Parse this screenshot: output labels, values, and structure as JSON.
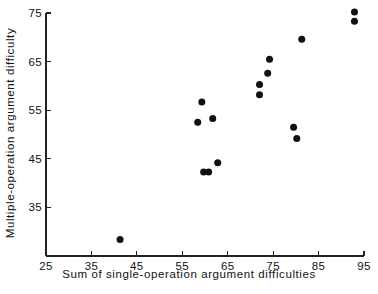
{
  "chart_data": {
    "type": "scatter",
    "title": "",
    "xlabel": "Sum of single-operation argument difficulties",
    "ylabel": "Multiple-operation argument difficulty",
    "xlim": [
      25,
      95
    ],
    "ylim": [
      25,
      75
    ],
    "xticks": [
      25,
      35,
      45,
      55,
      65,
      75,
      85,
      95
    ],
    "yticks": [
      35,
      45,
      55,
      65,
      75
    ],
    "xtick_labels": [
      "25",
      "35",
      "45",
      "55",
      "65",
      "75",
      "85",
      "95"
    ],
    "ytick_labels": [
      "35",
      "45",
      "55",
      "65",
      "75"
    ],
    "grid": false,
    "legend": null,
    "marker": {
      "shape": "circle",
      "color": "#111111",
      "size": 7
    },
    "points": [
      {
        "x": 41.3,
        "y": 28.4
      },
      {
        "x": 58.4,
        "y": 52.5
      },
      {
        "x": 59.3,
        "y": 56.7
      },
      {
        "x": 59.7,
        "y": 42.3
      },
      {
        "x": 60.8,
        "y": 42.3
      },
      {
        "x": 61.7,
        "y": 53.3
      },
      {
        "x": 62.8,
        "y": 44.2
      },
      {
        "x": 72.0,
        "y": 58.2
      },
      {
        "x": 72.0,
        "y": 60.3
      },
      {
        "x": 73.8,
        "y": 62.6
      },
      {
        "x": 74.2,
        "y": 65.5
      },
      {
        "x": 79.5,
        "y": 51.5
      },
      {
        "x": 80.2,
        "y": 49.2
      },
      {
        "x": 81.3,
        "y": 69.6
      },
      {
        "x": 92.9,
        "y": 73.3
      },
      {
        "x": 92.9,
        "y": 75.2
      }
    ]
  }
}
